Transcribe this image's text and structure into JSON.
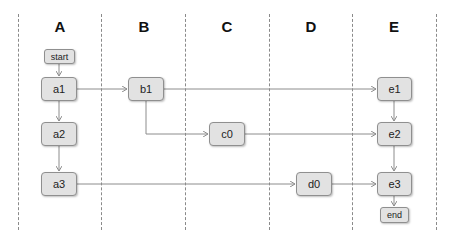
{
  "diagram": {
    "type": "swimlane-flow",
    "lanes": [
      {
        "id": "A",
        "label": "A"
      },
      {
        "id": "B",
        "label": "B"
      },
      {
        "id": "C",
        "label": "C"
      },
      {
        "id": "D",
        "label": "D"
      },
      {
        "id": "E",
        "label": "E"
      }
    ],
    "nodes": {
      "start": {
        "label": "start",
        "lane": "A"
      },
      "a1": {
        "label": "a1",
        "lane": "A"
      },
      "a2": {
        "label": "a2",
        "lane": "A"
      },
      "a3": {
        "label": "a3",
        "lane": "A"
      },
      "b1": {
        "label": "b1",
        "lane": "B"
      },
      "c0": {
        "label": "c0",
        "lane": "C"
      },
      "d0": {
        "label": "d0",
        "lane": "D"
      },
      "e1": {
        "label": "e1",
        "lane": "E"
      },
      "e2": {
        "label": "e2",
        "lane": "E"
      },
      "e3": {
        "label": "e3",
        "lane": "E"
      },
      "end": {
        "label": "end",
        "lane": "E"
      }
    },
    "edges": [
      {
        "from": "start",
        "to": "a1"
      },
      {
        "from": "a1",
        "to": "a2"
      },
      {
        "from": "a2",
        "to": "a3"
      },
      {
        "from": "a1",
        "to": "b1"
      },
      {
        "from": "b1",
        "to": "e1"
      },
      {
        "from": "b1",
        "to": "c0"
      },
      {
        "from": "c0",
        "to": "e2"
      },
      {
        "from": "a3",
        "to": "d0"
      },
      {
        "from": "d0",
        "to": "e3"
      },
      {
        "from": "e1",
        "to": "e2"
      },
      {
        "from": "e2",
        "to": "e3"
      },
      {
        "from": "e3",
        "to": "end"
      }
    ],
    "colors": {
      "node_fill": "#e2e2e2",
      "node_border": "#8f8f8f",
      "edge": "#8c8c8c",
      "lane_divider": "#8a8a8a"
    }
  }
}
